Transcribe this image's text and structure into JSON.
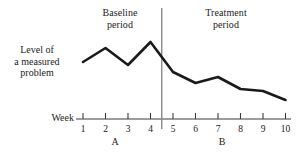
{
  "figure": {
    "y_axis_label": "Level of\na measured\nproblem",
    "week_axis_label": "Week",
    "phase_labels": [
      {
        "name": "baseline",
        "text": "Baseline\nperiod"
      },
      {
        "name": "treatment",
        "text": "Treatment\nperiod"
      }
    ],
    "phase_letters": [
      {
        "name": "phase-a",
        "text": "A",
        "x": 115
      },
      {
        "name": "phase-b",
        "text": "B",
        "x": 222
      }
    ],
    "colors": {
      "line": "#1a1a1a",
      "axis": "#3a3a3a",
      "divider": "#8a8a8a",
      "text": "#222222",
      "background": "#ffffff"
    }
  },
  "chart_data": {
    "type": "line",
    "title": "",
    "subtitle": "",
    "xlabel": "Week",
    "ylabel": "Level of a measured problem",
    "x": [
      1,
      2,
      3,
      4,
      5,
      6,
      7,
      8,
      9,
      10
    ],
    "tick_labels": [
      "1",
      "2",
      "3",
      "4",
      "5",
      "6",
      "7",
      "8",
      "9",
      "10"
    ],
    "series": [
      {
        "name": "Level of a measured problem",
        "values": [
          62,
          48,
          65,
          42,
          72,
          83,
          77,
          89,
          91,
          100
        ]
      }
    ],
    "values_are_pixel_y": true,
    "y_axis_shown": false,
    "ylim": [
      110,
      35
    ],
    "grid": false,
    "legend": "none",
    "annotations": [
      {
        "name": "phase-divider",
        "type": "vline",
        "x": 4.5,
        "label": ""
      },
      {
        "name": "baseline-period",
        "type": "phase",
        "x_range": [
          1,
          4.5
        ],
        "label": "Baseline period",
        "letter": "A"
      },
      {
        "name": "treatment-period",
        "type": "phase",
        "x_range": [
          4.5,
          10
        ],
        "label": "Treatment period",
        "letter": "B"
      }
    ]
  }
}
